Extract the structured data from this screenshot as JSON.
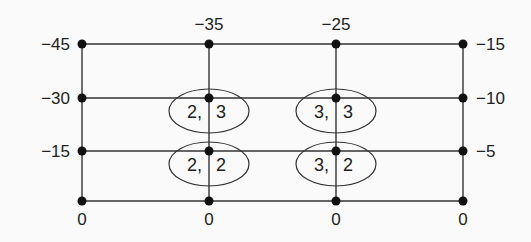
{
  "diagram": {
    "type": "game-tree-grid",
    "columns_x": [
      82,
      209,
      336,
      463
    ],
    "rows_y": [
      44,
      98,
      151,
      201
    ],
    "top_labels": [
      {
        "text": "−35",
        "x": 209,
        "y": 30
      },
      {
        "text": "−25",
        "x": 336,
        "y": 30
      }
    ],
    "left_labels": [
      {
        "text": "−45",
        "x": 70,
        "y": 50
      },
      {
        "text": "−30",
        "x": 70,
        "y": 104
      },
      {
        "text": "−15",
        "x": 70,
        "y": 157
      }
    ],
    "right_labels": [
      {
        "text": "−15",
        "x": 476,
        "y": 50
      },
      {
        "text": "−10",
        "x": 476,
        "y": 104
      },
      {
        "text": "−5",
        "x": 476,
        "y": 157
      }
    ],
    "bottom_labels": [
      {
        "text": "0",
        "x": 82,
        "y": 225
      },
      {
        "text": "0",
        "x": 209,
        "y": 225
      },
      {
        "text": "0",
        "x": 336,
        "y": 225
      },
      {
        "text": "0",
        "x": 463,
        "y": 225
      }
    ],
    "ellipses": [
      {
        "cx": 209,
        "cy": 111,
        "left": "2,",
        "right": "3"
      },
      {
        "cx": 336,
        "cy": 111,
        "left": "3,",
        "right": "3"
      },
      {
        "cx": 209,
        "cy": 164,
        "left": "2,",
        "right": "2"
      },
      {
        "cx": 336,
        "cy": 164,
        "left": "3,",
        "right": "2"
      }
    ],
    "colors": {
      "line": "#333333",
      "node": "#111111",
      "text": "#222222",
      "background": "#fafafa"
    }
  }
}
